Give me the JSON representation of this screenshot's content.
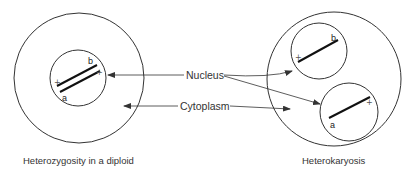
{
  "labels": {
    "nucleus": "Nucleus",
    "cytoplasm": "Cytoplasm"
  },
  "captions": {
    "left": "Heterozygosity in a diploid",
    "right": "Heterokaryosis"
  },
  "genes": {
    "left_b": "b",
    "left_a": "a",
    "left_plus1": "+",
    "left_plus2": "+",
    "right_top_b": "b",
    "right_top_plus": "+",
    "right_bottom_a": "a",
    "right_bottom_plus": "+"
  },
  "colors": {
    "stroke": "#333333",
    "chromosome": "#111111"
  }
}
